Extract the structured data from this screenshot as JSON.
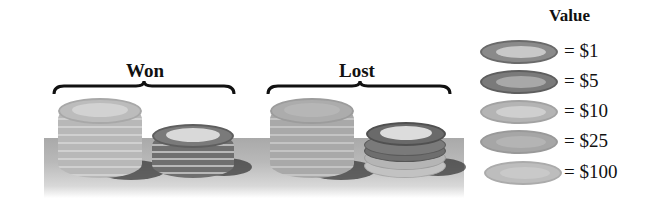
{
  "figure": {
    "groups": [
      {
        "label": "Won",
        "stacks": [
          {
            "chip_value": "$10",
            "chip_count": 8
          },
          {
            "chip_value": "$5",
            "chip_count": 5
          }
        ]
      },
      {
        "label": "Lost",
        "stacks": [
          {
            "chip_value": "$25",
            "chip_count": 8
          },
          {
            "chip_value": "mixed ($5, $1, $10)",
            "chip_count": 5
          }
        ]
      }
    ],
    "legend": {
      "title": "Value",
      "items": [
        {
          "label": "= $1",
          "color": "#8a8a8a",
          "inner": "#c8c8c8"
        },
        {
          "label": "= $5",
          "color": "#7a7a7a",
          "inner": "#b0b0b0"
        },
        {
          "label": "= $10",
          "color": "#b4b4b4",
          "inner": "#cfcfcf"
        },
        {
          "label": "= $25",
          "color": "#a6a6a6",
          "inner": "#b8b8b8"
        },
        {
          "label": "= $100",
          "color": "#bdbdbd",
          "inner": "#cacaca"
        }
      ]
    },
    "colors": {
      "table_top": "#a9a9a9",
      "text": "#111111"
    }
  }
}
